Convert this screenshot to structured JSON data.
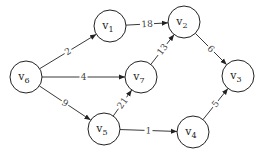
{
  "diagram": {
    "type": "directed weighted graph",
    "nodes": [
      {
        "id": "v1",
        "label": "v",
        "sub": "1",
        "x": 110,
        "y": 26
      },
      {
        "id": "v2",
        "label": "v",
        "sub": "2",
        "x": 184,
        "y": 22
      },
      {
        "id": "v3",
        "label": "v",
        "sub": "3",
        "x": 238,
        "y": 76
      },
      {
        "id": "v4",
        "label": "v",
        "sub": "4",
        "x": 193,
        "y": 132
      },
      {
        "id": "v5",
        "label": "v",
        "sub": "5",
        "x": 104,
        "y": 129
      },
      {
        "id": "v6",
        "label": "v",
        "sub": "6",
        "x": 26,
        "y": 77
      },
      {
        "id": "v7",
        "label": "v",
        "sub": "7",
        "x": 141,
        "y": 77
      }
    ],
    "edges": [
      {
        "from": "v6",
        "to": "v1",
        "weight": "2"
      },
      {
        "from": "v6",
        "to": "v7",
        "weight": "4"
      },
      {
        "from": "v6",
        "to": "v5",
        "weight": "9"
      },
      {
        "from": "v1",
        "to": "v2",
        "weight": "18"
      },
      {
        "from": "v7",
        "to": "v2",
        "weight": "13"
      },
      {
        "from": "v5",
        "to": "v7",
        "weight": "21"
      },
      {
        "from": "v5",
        "to": "v4",
        "weight": "1"
      },
      {
        "from": "v2",
        "to": "v3",
        "weight": "6"
      },
      {
        "from": "v4",
        "to": "v3",
        "weight": "5"
      }
    ]
  }
}
